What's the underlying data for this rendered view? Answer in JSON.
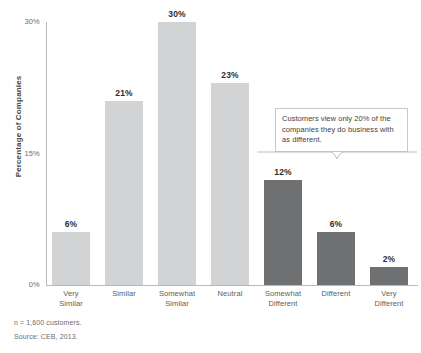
{
  "chart_data": {
    "type": "bar",
    "title": "",
    "xlabel": "",
    "ylabel": "Percentage of Companies",
    "ylim": [
      0,
      30
    ],
    "grid": false,
    "legend": "none",
    "categories": [
      "Very\nSimilar",
      "Similar",
      "Somewhat\nSimilar",
      "Neutral",
      "Somewhat\nDifferent",
      "Different",
      "Very\nDifferent"
    ],
    "values": [
      6,
      21,
      30,
      23,
      12,
      6,
      2
    ],
    "value_labels": [
      "6%",
      "21%",
      "30%",
      "23%",
      "12%",
      "6%",
      "2%"
    ],
    "bar_colors": [
      "#d2d3d4",
      "#d2d3d4",
      "#d2d3d4",
      "#d2d3d4",
      "#6f7072",
      "#6f7072",
      "#6f7072"
    ],
    "y_ticks": [
      0,
      15,
      30
    ],
    "y_tick_labels": [
      "0%",
      "15%",
      "30%"
    ],
    "annotations": [
      {
        "name": "callout",
        "text": "Customers view only 20% of the companies they do business with as different.",
        "covers_categories": [
          "Somewhat Different",
          "Different",
          "Very Different"
        ],
        "covers_total_percent": 20
      }
    ],
    "footnotes": [
      "n = 1,600 customers.",
      "Source: CEB, 2013."
    ]
  },
  "axis": {
    "y_title": "Percentage of Companies"
  },
  "bars": [
    {
      "category_line1": "Very",
      "category_line2": "Similar",
      "value_label": "6%"
    },
    {
      "category_line1": "Similar",
      "category_line2": "",
      "value_label": "21%"
    },
    {
      "category_line1": "Somewhat",
      "category_line2": "Similar",
      "value_label": "30%"
    },
    {
      "category_line1": "Neutral",
      "category_line2": "",
      "value_label": "23%"
    },
    {
      "category_line1": "Somewhat",
      "category_line2": "Different",
      "value_label": "12%"
    },
    {
      "category_line1": "Different",
      "category_line2": "",
      "value_label": "6%"
    },
    {
      "category_line1": "Very",
      "category_line2": "Different",
      "value_label": "2%"
    }
  ],
  "y_ticks": [
    {
      "label": "30%"
    },
    {
      "label": "15%"
    },
    {
      "label": "0%"
    }
  ],
  "callout": {
    "text": "Customers view only 20% of the companies they do business with as different."
  },
  "footnotes": {
    "sample": "n = 1,600 customers.",
    "source": "Source: CEB, 2013."
  },
  "colors": {
    "bar_light": "#d2d3d4",
    "bar_dark": "#6f7072",
    "axis": "#b9b9b9",
    "text": "#3b3b3b"
  }
}
